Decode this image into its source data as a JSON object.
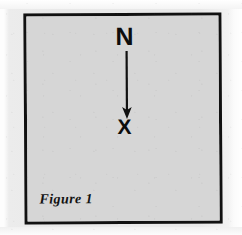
{
  "figure": {
    "caption": "Figure 1",
    "direction_label": "N",
    "point_marker": "X",
    "border_color": "#111111",
    "fill_color": "#d6d6d6",
    "ink_color": "#0d0d0d",
    "page_color": "#ededed"
  },
  "diagram_data": {
    "type": "diagram",
    "title": "Figure 1",
    "description": "North arrow pointing down from the letter N to a point marked X",
    "elements": [
      {
        "name": "north-label",
        "kind": "text",
        "value": "N",
        "x": 124,
        "y": 35
      },
      {
        "name": "direction-arrow",
        "kind": "arrow",
        "from_x": 124,
        "from_y": 48,
        "to_x": 124,
        "to_y": 106,
        "direction": "down",
        "has_arrowhead": true
      },
      {
        "name": "point-marker",
        "kind": "text",
        "value": "X",
        "x": 124,
        "y": 113
      },
      {
        "name": "figure-caption",
        "kind": "text",
        "value": "Figure 1",
        "x": 36,
        "y": 203
      }
    ],
    "frame": {
      "x": 24,
      "y": 13,
      "width": 198,
      "height": 211,
      "border_width": 3
    }
  }
}
